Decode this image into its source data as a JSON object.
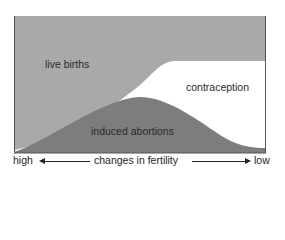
{
  "diagram": {
    "regions": [
      {
        "id": "live_births",
        "label": "live births",
        "color": "#a9a9a9"
      },
      {
        "id": "contraception",
        "label": "contraception",
        "color": "#ffffff"
      },
      {
        "id": "induced_abortions",
        "label": "induced abortions",
        "color": "#7d7d7d"
      }
    ],
    "x_axis": {
      "left_label": "high",
      "center_label": "changes in fertility",
      "right_label": "low"
    },
    "frame_color": "#555555"
  }
}
